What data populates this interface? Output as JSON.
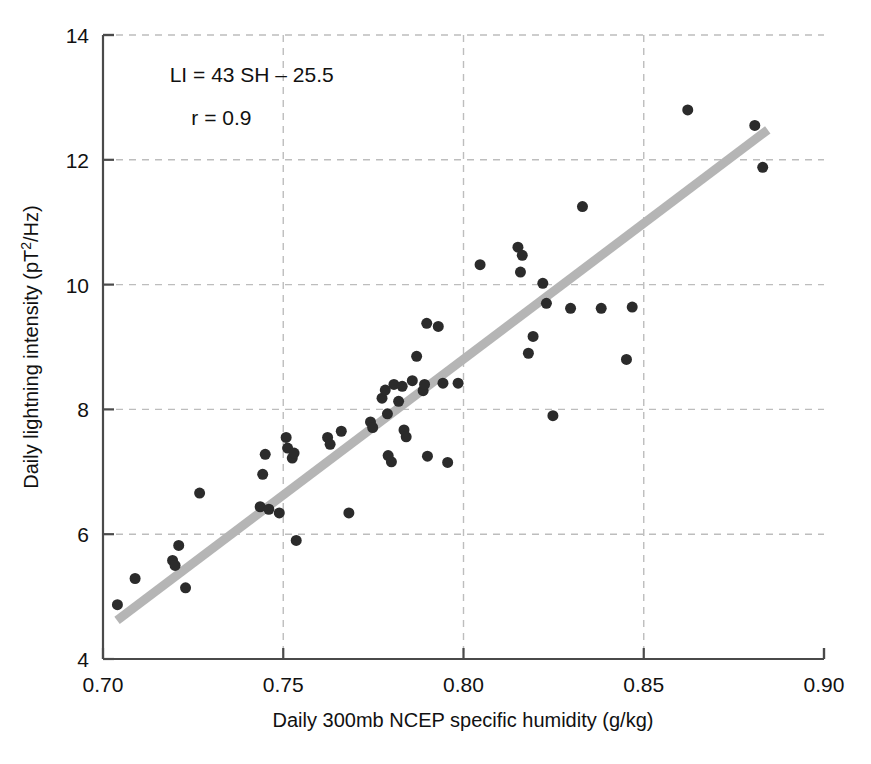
{
  "chart_data": {
    "type": "scatter",
    "title": "",
    "xlabel": "Daily 300mb NCEP specific humidity (g/kg)",
    "ylabel": "Daily lightning intensity (pT2/Hz)",
    "ylabel_parts": {
      "prefix": "Daily lightning intensity (pT",
      "superscript": "2",
      "suffix": "/Hz)"
    },
    "xlim": [
      0.7,
      0.9
    ],
    "ylim": [
      4,
      14
    ],
    "xticks": [
      0.7,
      0.75,
      0.8,
      0.85,
      0.9
    ],
    "xtick_labels": [
      "0.70",
      "0.75",
      "0.80",
      "0.85",
      "0.90"
    ],
    "yticks": [
      4,
      6,
      8,
      10,
      12,
      14
    ],
    "ytick_labels": [
      "4",
      "6",
      "8",
      "10",
      "12",
      "14"
    ],
    "grid": true,
    "grid_style": "dashed",
    "grid_color": "#bdbdbd",
    "legend": "none",
    "marker_color": "#2b2b2b",
    "marker_size": 11,
    "annotations": [
      {
        "text": "LI = 43 SH – 25.5",
        "x": 0.7185,
        "y": 13.25
      },
      {
        "text": "r = 0.9",
        "x": 0.7245,
        "y": 12.55
      }
    ],
    "fit_line": {
      "label": "LI = 43 SH - 25.5",
      "slope": 43,
      "intercept": -25.5,
      "r": 0.9,
      "color": "#b5b5b5",
      "width": 9,
      "x_start": 0.7039,
      "y_start": 4.62,
      "x_end": 0.8844,
      "y_end": 12.48
    },
    "points": [
      {
        "x": 0.704,
        "y": 4.87
      },
      {
        "x": 0.7089,
        "y": 5.29
      },
      {
        "x": 0.7193,
        "y": 5.58
      },
      {
        "x": 0.72,
        "y": 5.5
      },
      {
        "x": 0.721,
        "y": 5.82
      },
      {
        "x": 0.7229,
        "y": 5.14
      },
      {
        "x": 0.7268,
        "y": 6.66
      },
      {
        "x": 0.7436,
        "y": 6.44
      },
      {
        "x": 0.7443,
        "y": 6.96
      },
      {
        "x": 0.745,
        "y": 7.28
      },
      {
        "x": 0.746,
        "y": 6.4
      },
      {
        "x": 0.7489,
        "y": 6.34
      },
      {
        "x": 0.7508,
        "y": 7.55
      },
      {
        "x": 0.7512,
        "y": 7.38
      },
      {
        "x": 0.7525,
        "y": 7.22
      },
      {
        "x": 0.753,
        "y": 7.3
      },
      {
        "x": 0.7536,
        "y": 5.9
      },
      {
        "x": 0.7623,
        "y": 7.55
      },
      {
        "x": 0.763,
        "y": 7.44
      },
      {
        "x": 0.7661,
        "y": 7.65
      },
      {
        "x": 0.7682,
        "y": 6.34
      },
      {
        "x": 0.7742,
        "y": 7.8
      },
      {
        "x": 0.7748,
        "y": 7.71
      },
      {
        "x": 0.7774,
        "y": 8.18
      },
      {
        "x": 0.7783,
        "y": 8.31
      },
      {
        "x": 0.7789,
        "y": 7.93
      },
      {
        "x": 0.7791,
        "y": 7.26
      },
      {
        "x": 0.78,
        "y": 7.16
      },
      {
        "x": 0.7807,
        "y": 8.4
      },
      {
        "x": 0.782,
        "y": 8.13
      },
      {
        "x": 0.783,
        "y": 8.37
      },
      {
        "x": 0.7835,
        "y": 7.67
      },
      {
        "x": 0.7841,
        "y": 7.56
      },
      {
        "x": 0.7858,
        "y": 8.46
      },
      {
        "x": 0.787,
        "y": 8.85
      },
      {
        "x": 0.7888,
        "y": 8.3
      },
      {
        "x": 0.7892,
        "y": 8.4
      },
      {
        "x": 0.7898,
        "y": 9.38
      },
      {
        "x": 0.79,
        "y": 7.25
      },
      {
        "x": 0.793,
        "y": 9.33
      },
      {
        "x": 0.7943,
        "y": 8.42
      },
      {
        "x": 0.7956,
        "y": 7.15
      },
      {
        "x": 0.7985,
        "y": 8.42
      },
      {
        "x": 0.8046,
        "y": 10.32
      },
      {
        "x": 0.8151,
        "y": 10.6
      },
      {
        "x": 0.8158,
        "y": 10.2
      },
      {
        "x": 0.8163,
        "y": 10.47
      },
      {
        "x": 0.818,
        "y": 8.9
      },
      {
        "x": 0.8193,
        "y": 9.17
      },
      {
        "x": 0.822,
        "y": 10.02
      },
      {
        "x": 0.823,
        "y": 9.7
      },
      {
        "x": 0.8248,
        "y": 7.9
      },
      {
        "x": 0.8297,
        "y": 9.62
      },
      {
        "x": 0.833,
        "y": 11.25
      },
      {
        "x": 0.8382,
        "y": 9.62
      },
      {
        "x": 0.8452,
        "y": 8.8
      },
      {
        "x": 0.8468,
        "y": 9.64
      },
      {
        "x": 0.8622,
        "y": 12.8
      },
      {
        "x": 0.8808,
        "y": 12.55
      },
      {
        "x": 0.883,
        "y": 11.88
      }
    ]
  }
}
